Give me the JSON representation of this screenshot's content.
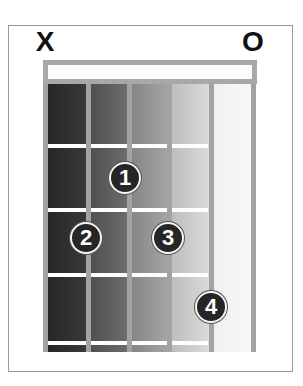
{
  "chord_diagram": {
    "string_markers": [
      {
        "string": 6,
        "symbol": "X",
        "meaning": "muted"
      },
      {
        "string": 1,
        "symbol": "O",
        "meaning": "open"
      }
    ],
    "strings": 6,
    "frets_shown": 4,
    "fingers": [
      {
        "label": "1",
        "string": 4,
        "fret": 2
      },
      {
        "label": "2",
        "string": 5,
        "fret": 3
      },
      {
        "label": "3",
        "string": 3,
        "fret": 3
      },
      {
        "label": "4",
        "string": 2,
        "fret": 4
      }
    ],
    "colors": {
      "finger_fill": "#262626",
      "finger_outline": "#f4f4f4",
      "string": "#a3a3a3",
      "nut": "#a8a8a8",
      "fret_line": "#ffffff",
      "border": "#9a9a9a"
    }
  }
}
